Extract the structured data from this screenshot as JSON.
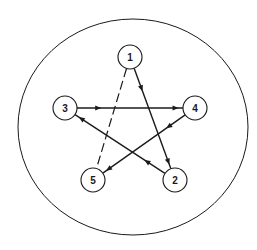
{
  "diagram": {
    "type": "directed-graph",
    "boundary": {
      "cx": 133,
      "cy": 127,
      "rx": 115,
      "ry": 108
    },
    "stroke_color": "#1a1a1a",
    "background": "#ffffff",
    "node_radius": 12,
    "nodes": [
      {
        "id": "1",
        "label": "1",
        "x": 130,
        "y": 57
      },
      {
        "id": "2",
        "label": "2",
        "x": 175,
        "y": 180
      },
      {
        "id": "3",
        "label": "3",
        "x": 65,
        "y": 108
      },
      {
        "id": "4",
        "label": "4",
        "x": 195,
        "y": 108
      },
      {
        "id": "5",
        "label": "5",
        "x": 93,
        "y": 180
      }
    ],
    "edges": [
      {
        "from": "1",
        "to": "2",
        "style": "solid",
        "directed": true
      },
      {
        "from": "3",
        "to": "4",
        "style": "solid",
        "directed": true
      },
      {
        "from": "4",
        "to": "5",
        "style": "solid",
        "directed": true
      },
      {
        "from": "2",
        "to": "3",
        "style": "solid",
        "directed": true
      },
      {
        "from": "1",
        "to": "5",
        "style": "dashed",
        "directed": false
      }
    ]
  }
}
